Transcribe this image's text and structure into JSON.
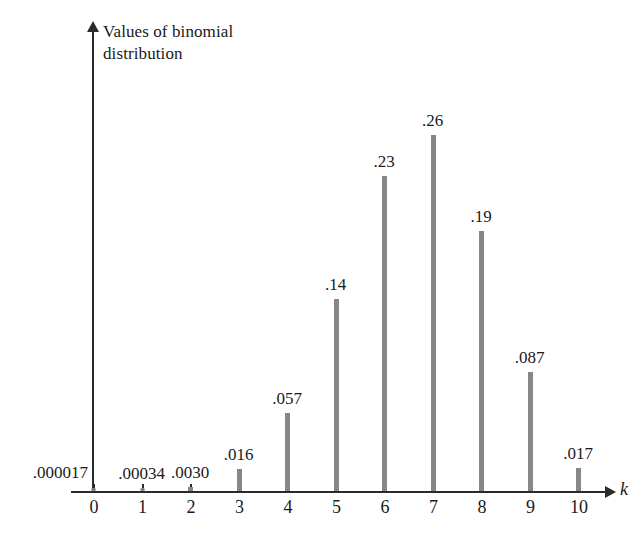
{
  "chart_data": {
    "type": "bar",
    "title": "Values of binomial distribution",
    "xlabel": "k",
    "ylabel": "Values of binomial distribution",
    "categories": [
      "0",
      "1",
      "2",
      "3",
      "4",
      "5",
      "6",
      "7",
      "8",
      "9",
      "10"
    ],
    "values": [
      1.7e-05,
      0.00034,
      0.003,
      0.016,
      0.057,
      0.14,
      0.23,
      0.26,
      0.19,
      0.087,
      0.017
    ],
    "value_labels": [
      ".000017",
      ".00034",
      ".0030",
      ".016",
      ".057",
      ".14",
      ".23",
      ".26",
      ".19",
      ".087",
      ".017"
    ],
    "xlim": [
      0,
      10
    ],
    "ylim": [
      0,
      0.28
    ],
    "grid": false,
    "legend": null,
    "bar_color": "#878787",
    "axis_color": "#2b2b2b",
    "text_color": "#1a1a1a"
  },
  "axis": {
    "y_title_line1": "Values of binomial",
    "y_title_line2": "distribution",
    "x_title": "k"
  },
  "ticks": {
    "labels": [
      "0",
      "1",
      "2",
      "3",
      "4",
      "5",
      "6",
      "7",
      "8",
      "9",
      "10"
    ]
  }
}
